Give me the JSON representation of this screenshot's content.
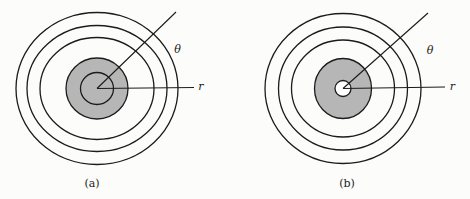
{
  "figure": {
    "background": "#fcfcfa",
    "stroke_color": "#1b1b1b",
    "shaded_fill": "#b6b6b6",
    "hole_fill": "#ffffff",
    "circle_stroke_width": 1.3,
    "line_stroke_width": 1.1,
    "diagrams": [
      {
        "id": "a",
        "center": {
          "x": 97,
          "y": 88.5
        },
        "rings": [
          {
            "name": "outer-ring",
            "rx": 81,
            "ry": 76,
            "fill": "none"
          },
          {
            "name": "ring-2",
            "rx": 70,
            "ry": 63,
            "fill": "none"
          },
          {
            "name": "ring-3",
            "rx": 57,
            "ry": 51,
            "fill": "none"
          },
          {
            "name": "shaded-disk",
            "rx": 31,
            "ry": 30.5,
            "fill": "#b6b6b6"
          },
          {
            "name": "inner-circle",
            "rx": 16.5,
            "ry": 16,
            "fill": "#b6b6b6"
          }
        ],
        "rays": [
          {
            "name": "theta-ray",
            "x2": 176,
            "y2": 12
          },
          {
            "name": "r-ray",
            "x2": 194,
            "y2": 87.5
          }
        ],
        "labels": [
          {
            "name": "theta-label",
            "text": "θ",
            "x": 177.5,
            "y": 53,
            "italic": true
          },
          {
            "name": "r-label",
            "text": "r",
            "x": 201,
            "y": 90,
            "italic": true
          },
          {
            "name": "caption-a",
            "text": "(a)",
            "x": 92,
            "y": 187,
            "italic": false
          }
        ]
      },
      {
        "id": "b",
        "center": {
          "x": 343,
          "y": 88.5
        },
        "rings": [
          {
            "name": "outer-ring",
            "rx": 78,
            "ry": 75,
            "fill": "none"
          },
          {
            "name": "ring-2",
            "rx": 64.5,
            "ry": 61.5,
            "fill": "none"
          },
          {
            "name": "ring-3",
            "rx": 51.5,
            "ry": 48.5,
            "fill": "none"
          },
          {
            "name": "shaded-disk",
            "rx": 28.5,
            "ry": 30,
            "fill": "#b6b6b6"
          },
          {
            "name": "center-hole",
            "rx": 8,
            "ry": 8,
            "fill": "#ffffff"
          }
        ],
        "rays": [
          {
            "name": "theta-ray",
            "x2": 428,
            "y2": 13
          },
          {
            "name": "r-ray",
            "x2": 445,
            "y2": 87
          }
        ],
        "labels": [
          {
            "name": "theta-label",
            "text": "θ",
            "x": 430,
            "y": 54,
            "italic": true
          },
          {
            "name": "r-label",
            "text": "r",
            "x": 452.5,
            "y": 89.5,
            "italic": true
          },
          {
            "name": "caption-b",
            "text": "(b)",
            "x": 347,
            "y": 187,
            "italic": false
          }
        ]
      }
    ]
  }
}
